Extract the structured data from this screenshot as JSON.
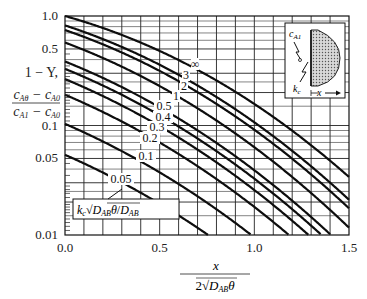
{
  "chart_data": {
    "type": "line",
    "title": "",
    "xlabel": "x / (2√(D_AB θ))",
    "ylabel": "1 − Y,  (c_Aθ − c_A0)/(c_A1 − c_A0)",
    "xlim": [
      0.0,
      1.5
    ],
    "ylim": [
      0.01,
      1.0
    ],
    "yscale": "log",
    "grid": true,
    "x_ticks": [
      "0.0",
      "0.5",
      "1.0",
      "1.5"
    ],
    "y_ticks": [
      "1.0",
      "0.5",
      "0.1",
      "0.05",
      "0.01"
    ],
    "parameter_label": "k_c √(D_AB θ) / D_AB",
    "series": [
      {
        "name": "∞",
        "h": 1000
      },
      {
        "name": "3",
        "h": 3
      },
      {
        "name": "2",
        "h": 2
      },
      {
        "name": "1",
        "h": 1
      },
      {
        "name": "0.5",
        "h": 0.5
      },
      {
        "name": "0.4",
        "h": 0.4
      },
      {
        "name": "0.3",
        "h": 0.3
      },
      {
        "name": "0.2",
        "h": 0.2
      },
      {
        "name": "0.1",
        "h": 0.1
      },
      {
        "name": "0.05",
        "h": 0.05
      }
    ],
    "formula": "1 − Y = erfc(η) − exp(2hη + h²)·erfc(η + h)",
    "inset": {
      "labels": [
        "c_A1",
        "k_c",
        "x"
      ],
      "description": "semi-infinite solid with surface resistance"
    }
  },
  "labels": {
    "y_main": "1 − Y,",
    "y_frac_num": "c_Aθ − c_A0",
    "y_frac_den": "c_A1 − c_A0",
    "x_num": "x",
    "x_den": "2√D_ABθ",
    "param_box": "k_c √D_ABθ / D_AB"
  }
}
